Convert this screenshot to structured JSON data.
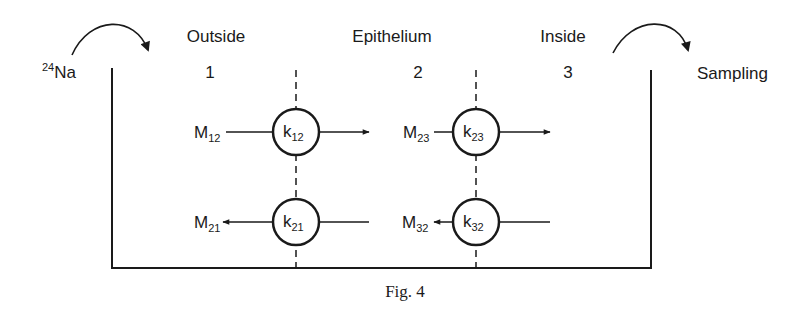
{
  "diagram": {
    "tracer": {
      "isotope_mass": "24",
      "element": "Na"
    },
    "sampling_label": "Sampling",
    "compartments": [
      {
        "name": "Outside",
        "number": "1"
      },
      {
        "name": "Epithelium",
        "number": "2"
      },
      {
        "name": "Inside",
        "number": "3"
      }
    ],
    "fluxes": {
      "m12": {
        "base": "M",
        "sub": "12"
      },
      "m21": {
        "base": "M",
        "sub": "21"
      },
      "m23": {
        "base": "M",
        "sub": "23"
      },
      "m32": {
        "base": "M",
        "sub": "32"
      }
    },
    "rate_constants": {
      "k12": {
        "base": "k",
        "sub": "12"
      },
      "k21": {
        "base": "k",
        "sub": "21"
      },
      "k23": {
        "base": "k",
        "sub": "23"
      },
      "k32": {
        "base": "k",
        "sub": "32"
      }
    },
    "caption": "Fig. 4"
  }
}
